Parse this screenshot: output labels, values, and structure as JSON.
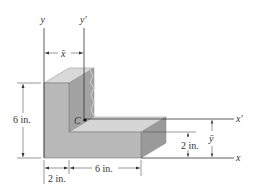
{
  "figure": {
    "colors": {
      "background": "#ffffff",
      "front_face": "#b5b5b5",
      "top_face": "#d6d6d6",
      "side_face": "#9c9c9c",
      "inner_shadow_face": "#a8a8a8",
      "line": "#333333",
      "dim_line": "#555555"
    },
    "axes": {
      "y_label": "y",
      "y_prime_label": "y′",
      "x_label": "x",
      "x_prime_label": "x′"
    },
    "centroid": {
      "label": "C"
    },
    "dimensions": {
      "x_bar_label": "x̄",
      "y_bar_label": "ȳ",
      "height_label": "6 in.",
      "leg_width_label": "2 in.",
      "base_length_label": "6 in.",
      "base_thickness_label": "2 in."
    }
  }
}
